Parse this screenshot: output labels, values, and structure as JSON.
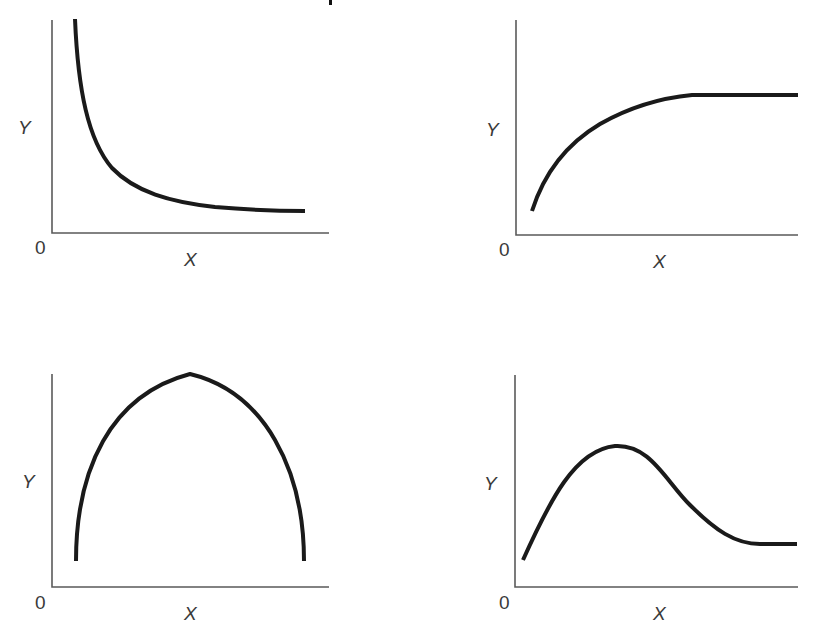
{
  "figure": {
    "title_fragment_visible": true
  },
  "chart_data": [
    {
      "type": "line",
      "panel": "top-left",
      "title": "",
      "xlabel": "X",
      "ylabel": "Y",
      "origin_label": "0",
      "shape": "decreasing, convex (hyperbolic decay to a floor)",
      "grid": false,
      "x": [
        0.08,
        0.12,
        0.2,
        0.3,
        0.4,
        0.55,
        0.7,
        0.85,
        0.9
      ],
      "values": [
        1.0,
        0.6,
        0.38,
        0.26,
        0.19,
        0.14,
        0.12,
        0.11,
        0.11
      ],
      "xlim": [
        0,
        1
      ],
      "ylim": [
        0,
        1
      ]
    },
    {
      "type": "line",
      "panel": "top-right",
      "title": "",
      "xlabel": "X",
      "ylabel": "Y",
      "origin_label": "0",
      "shape": "increasing, concave, then flat plateau",
      "grid": false,
      "x": [
        0.06,
        0.12,
        0.2,
        0.3,
        0.45,
        0.62,
        0.8,
        1.0
      ],
      "values": [
        0.11,
        0.35,
        0.5,
        0.6,
        0.67,
        0.7,
        0.7,
        0.7
      ],
      "xlim": [
        0,
        1
      ],
      "ylim": [
        0,
        1
      ]
    },
    {
      "type": "line",
      "panel": "bottom-left",
      "title": "",
      "xlabel": "X",
      "ylabel": "Y",
      "origin_label": "0",
      "shape": "inverted U (semi-elliptical arch)",
      "grid": false,
      "x": [
        0.09,
        0.12,
        0.2,
        0.3,
        0.5,
        0.7,
        0.8,
        0.88,
        0.91
      ],
      "values": [
        0.12,
        0.5,
        0.75,
        0.9,
        0.98,
        0.88,
        0.72,
        0.48,
        0.12
      ],
      "xlim": [
        0,
        1
      ],
      "ylim": [
        0,
        1
      ]
    },
    {
      "type": "line",
      "panel": "bottom-right",
      "title": "",
      "xlabel": "X",
      "ylabel": "Y",
      "origin_label": "0",
      "shape": "rises to a peak, declines, then levels off",
      "grid": false,
      "x": [
        0.03,
        0.15,
        0.25,
        0.35,
        0.45,
        0.55,
        0.68,
        0.84,
        1.0
      ],
      "values": [
        0.13,
        0.45,
        0.62,
        0.66,
        0.56,
        0.38,
        0.25,
        0.2,
        0.2
      ],
      "xlim": [
        0,
        1
      ],
      "ylim": [
        0,
        1
      ]
    }
  ],
  "panels": [
    {
      "id": "top-left",
      "y_label": "Y",
      "x_label": "X",
      "origin": "0",
      "axis_path": "M52,20 L52,233 L329,233",
      "curve_path": "M75,19 C78,90 88,140 112,168 C135,192 170,202 215,207 C250,210 280,211 305,211",
      "y_label_pos": [
        18,
        134
      ],
      "x_label_pos": [
        184,
        266
      ],
      "origin_pos": [
        35,
        254
      ]
    },
    {
      "id": "top-right",
      "y_label": "Y",
      "x_label": "X",
      "origin": "0",
      "axis_path": "M516,20 L516,235 L798,235",
      "curve_path": "M532,211 C545,170 568,143 600,124 C630,107 660,98 692,95 L798,95",
      "y_label_pos": [
        486,
        136
      ],
      "x_label_pos": [
        653,
        268
      ],
      "origin_pos": [
        499,
        256
      ]
    },
    {
      "id": "bottom-left",
      "y_label": "Y",
      "x_label": "X",
      "origin": "0",
      "axis_path": "M52,374 L52,587 L329,587",
      "curve_path": "M76,561 C76,470 110,395 190,374 C265,392 304,470 304,561",
      "y_label_pos": [
        22,
        488
      ],
      "x_label_pos": [
        184,
        620
      ],
      "origin_pos": [
        35,
        609
      ]
    },
    {
      "id": "bottom-right",
      "y_label": "Y",
      "x_label": "X",
      "origin": "0",
      "axis_path": "M515,375 L515,587 L798,587",
      "curve_path": "M523,560 C550,500 575,450 615,446 C650,444 665,480 690,505 C715,530 735,544 760,544 L797,544",
      "y_label_pos": [
        484,
        490
      ],
      "x_label_pos": [
        653,
        620
      ],
      "origin_pos": [
        499,
        609
      ]
    }
  ],
  "colors": {
    "curve": "#1a1a1a",
    "axis": "#5a5a5a",
    "label": "#3a3a3a",
    "background": "#ffffff"
  }
}
